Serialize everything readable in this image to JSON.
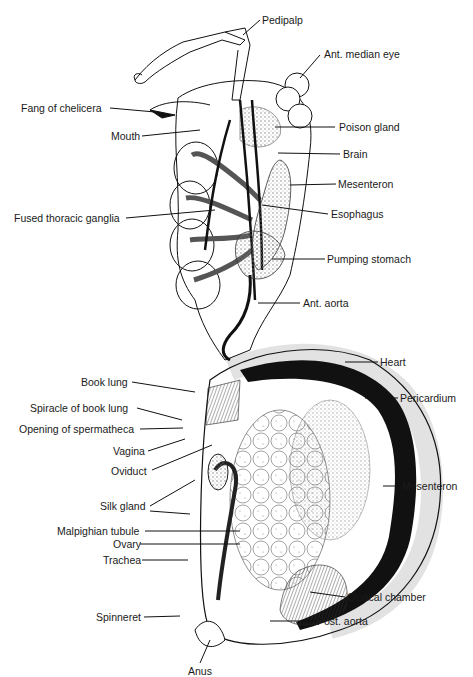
{
  "diagram": {
    "labels": {
      "pedipalp": "Pedipalp",
      "ant_median_eye": "Ant. median eye",
      "fang_of_chelicera": "Fang of chelicera",
      "mouth": "Mouth",
      "poison_gland": "Poison gland",
      "brain": "Brain",
      "mesenteron_upper": "Mesenteron",
      "fused_thoracic_ganglia": "Fused thoracic ganglia",
      "esophagus": "Esophagus",
      "pumping_stomach": "Pumping stomach",
      "ant_aorta": "Ant. aorta",
      "heart": "Heart",
      "book_lung": "Book lung",
      "pericardium": "Pericardium",
      "spiracle_of_book_lung": "Spiracle of book lung",
      "opening_of_spermatheca": "Opening of spermatheca",
      "vagina": "Vagina",
      "oviduct": "Oviduct",
      "mesenteron_lower": "Mesenteron",
      "silk_gland": "Silk gland",
      "malpighian_tubule": "Malpighian tubule",
      "ovary": "Ovary",
      "trachea": "Trachea",
      "cloacal_chamber": "Cloacal chamber",
      "spinneret": "Spinneret",
      "post_aorta": "Post. aorta",
      "anus": "Anus"
    },
    "colors": {
      "ink": "#111111",
      "background": "#ffffff",
      "stipple": "#9a9a9a"
    }
  }
}
